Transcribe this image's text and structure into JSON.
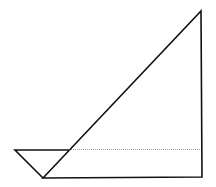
{
  "diagram": {
    "colors": {
      "stroke": "#111111",
      "dotted": "#777777",
      "background": "#ffffff"
    },
    "points": {
      "left": [
        15,
        150
      ],
      "bottom": [
        43,
        178
      ],
      "cross": [
        69,
        150
      ],
      "top": [
        201,
        11
      ],
      "bottom_right": [
        202,
        177
      ],
      "dotted_end": [
        201,
        149
      ]
    }
  }
}
